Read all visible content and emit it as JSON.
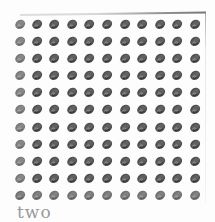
{
  "page": {
    "caption": "two",
    "grid": {
      "rows": 11,
      "columns": 11,
      "icon": "shell-icon",
      "icon_color": "#3c3c3c",
      "icon_highlight_color": "#9a9a9a"
    },
    "colors": {
      "background": "#fdfdfd",
      "caption": "#9a9a9a"
    }
  }
}
